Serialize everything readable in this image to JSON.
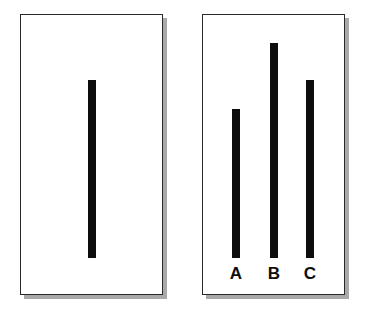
{
  "figure": {
    "type": "line-comparison",
    "colors": {
      "bar": "#0d0d0d",
      "card_border": "#2a2a2a",
      "card_shadow": "#a9a9a9",
      "background": "#ffffff"
    },
    "reference_card": {
      "line": {
        "top": 80,
        "bottom": 258,
        "length_px": 178
      }
    },
    "comparison_card": {
      "lines": [
        {
          "label": "A",
          "top": 109,
          "bottom": 258,
          "length_px": 149
        },
        {
          "label": "B",
          "top": 43,
          "bottom": 258,
          "length_px": 215
        },
        {
          "label": "C",
          "top": 80,
          "bottom": 258,
          "length_px": 178
        }
      ]
    }
  }
}
